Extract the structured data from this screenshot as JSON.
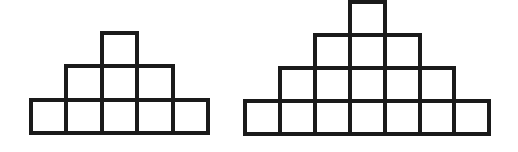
{
  "canvas": {
    "width": 518,
    "height": 152,
    "background_color": "#ffffff"
  },
  "style": {
    "stroke_color": "#1a1a1a",
    "stroke_width": 4,
    "cell_fill_color": "#ffffff"
  },
  "figures": [
    {
      "id": "left-figure",
      "name": "staircase-pyramid-3-rows",
      "rows_count": 3,
      "total_squares": 9,
      "row_square_counts": [
        1,
        3,
        5
      ],
      "origin_x": 31,
      "origin_y": 33,
      "cell_width": 35.4,
      "cell_height": 33.3,
      "base_width": 177,
      "total_height": 100
    },
    {
      "id": "right-figure",
      "name": "staircase-pyramid-4-rows",
      "rows_count": 4,
      "total_squares": 16,
      "row_square_counts": [
        1,
        3,
        5,
        7
      ],
      "origin_x": 245,
      "origin_y": 2,
      "cell_width": 34.9,
      "cell_height": 33.0,
      "base_width": 244,
      "total_height": 132
    }
  ]
}
